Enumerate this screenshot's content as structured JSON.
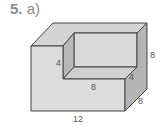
{
  "problem": {
    "number": "5.",
    "part": "a)"
  },
  "figure": {
    "type": "L-shaped rectangular prism (cuboid with corner notch)",
    "colors": {
      "front": "#dcdcdc",
      "top": "#d4d4d4",
      "side": "#b4b4b4",
      "inner": "#d8d8d8",
      "edge": "#444444"
    },
    "dimensions": {
      "notch_height": "4",
      "notch_length": "8",
      "notch_depth": "4",
      "height": "8",
      "depth": "8",
      "length": "12"
    }
  }
}
